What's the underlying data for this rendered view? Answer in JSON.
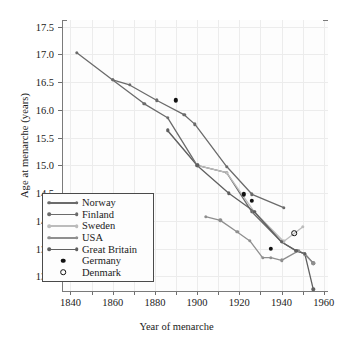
{
  "chart_data": {
    "type": "line",
    "title": "",
    "xlabel": "Year of menarche",
    "ylabel": "Age at menarche (years)",
    "xlim": [
      1836,
      1962
    ],
    "ylim": [
      12.72,
      17.62
    ],
    "xticks": [
      1840,
      1860,
      1880,
      1900,
      1920,
      1940,
      1960
    ],
    "xticklabels": [
      "1840",
      "1860",
      "1880",
      "1900",
      "1920",
      "1940",
      "1960"
    ],
    "xminorticks": [
      1850,
      1870,
      1890,
      1910,
      1930,
      1950
    ],
    "yticks": [
      13.0,
      13.5,
      14.0,
      14.5,
      15.0,
      15.5,
      16.0,
      16.5,
      17.0,
      17.5
    ],
    "yticklabels": [
      "13.0",
      "13.5",
      "14.0",
      "14.5",
      "15.0",
      "15.5",
      "16.0",
      "16.5",
      "17.0",
      "17.5"
    ],
    "grid": true,
    "legend_position": "lower-left",
    "series": [
      {
        "name": "Norway",
        "color": "#6b6b6b",
        "marker": "circle",
        "points": [
          [
            1843,
            17.03
          ],
          [
            1860,
            16.54
          ],
          [
            1868,
            16.45
          ],
          [
            1881,
            16.17
          ],
          [
            1894,
            15.91
          ],
          [
            1899,
            15.74
          ],
          [
            1914,
            14.98
          ],
          [
            1926,
            14.48
          ],
          [
            1941,
            14.24
          ]
        ]
      },
      {
        "name": "Finland",
        "color": "#6b6b6b",
        "marker": "circle",
        "points": [
          [
            1860,
            16.54
          ],
          [
            1875,
            16.11
          ],
          [
            1886,
            15.86
          ],
          [
            1900,
            15.0
          ],
          [
            1914,
            14.87
          ],
          [
            1926,
            14.16
          ],
          [
            1940,
            13.62
          ],
          [
            1947,
            13.46
          ],
          [
            1951,
            13.41
          ],
          [
            1955,
            13.24
          ]
        ]
      },
      {
        "name": "Sweden",
        "color": "#bcbcbc",
        "marker": "circle",
        "points": [
          [
            1886,
            15.63
          ],
          [
            1900,
            15.0
          ],
          [
            1914,
            14.87
          ],
          [
            1927,
            14.17
          ],
          [
            1941,
            13.63
          ],
          [
            1950,
            13.89
          ]
        ]
      },
      {
        "name": "USA",
        "color": "#8f8f8f",
        "marker": "circle",
        "points": [
          [
            1904,
            14.08
          ],
          [
            1911,
            14.01
          ],
          [
            1919,
            13.8
          ],
          [
            1925,
            13.64
          ],
          [
            1931,
            13.34
          ],
          [
            1935,
            13.34
          ],
          [
            1940,
            13.29
          ],
          [
            1948,
            13.46
          ],
          [
            1951,
            13.4
          ],
          [
            1955,
            13.24
          ]
        ]
      },
      {
        "name": "Great Britain",
        "color": "#606060",
        "marker": "circle",
        "points": [
          [
            1886,
            15.63
          ],
          [
            1900,
            15.0
          ],
          [
            1915,
            14.5
          ],
          [
            1927,
            14.17
          ],
          [
            1940,
            13.62
          ],
          [
            1947,
            13.46
          ],
          [
            1951,
            13.41
          ],
          [
            1955,
            12.77
          ]
        ]
      }
    ],
    "point_series": [
      {
        "name": "Germany",
        "color": "#111111",
        "marker": "filled-circle",
        "points": [
          [
            1890,
            16.17
          ],
          [
            1922,
            14.48
          ],
          [
            1926,
            14.36
          ],
          [
            1935,
            13.5
          ]
        ]
      },
      {
        "name": "Denmark",
        "color": "#111111",
        "marker": "open-circle",
        "points": [
          [
            1946,
            13.78
          ]
        ]
      }
    ]
  },
  "legend": {
    "entries": [
      {
        "label": "Norway",
        "kind": "line",
        "color": "#6b6b6b"
      },
      {
        "label": "Finland",
        "kind": "line",
        "color": "#6b6b6b"
      },
      {
        "label": "Sweden",
        "kind": "line",
        "color": "#bcbcbc"
      },
      {
        "label": "USA",
        "kind": "line",
        "color": "#8f8f8f"
      },
      {
        "label": "Great Britain",
        "kind": "line",
        "color": "#606060"
      },
      {
        "label": "Germany",
        "kind": "filled-dot",
        "color": "#111111"
      },
      {
        "label": "Denmark",
        "kind": "open-dot",
        "color": "#111111"
      }
    ]
  },
  "colors": {
    "plot_background": "#fdfdfd",
    "page_background": "#ffffff",
    "grid": "#ececec",
    "axis": "#7a7a7a",
    "text": "#1a1a1a"
  }
}
